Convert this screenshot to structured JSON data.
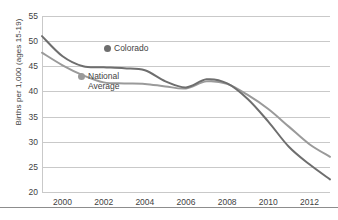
{
  "chart_data": {
    "type": "line",
    "title": "",
    "xlabel": "",
    "ylabel": "Births per 1,000 (ages 15-19)",
    "ylim": [
      20,
      55
    ],
    "xlim": [
      1999,
      2013
    ],
    "ytick_labels": [
      "20",
      "25",
      "30",
      "35",
      "40",
      "45",
      "50",
      "55"
    ],
    "ytick_values": [
      20,
      25,
      30,
      35,
      40,
      45,
      50,
      55
    ],
    "xtick_labels": [
      "2000",
      "2002",
      "2004",
      "2006",
      "2008",
      "2010",
      "2012"
    ],
    "xtick_values": [
      2000,
      2002,
      2004,
      2006,
      2008,
      2010,
      2012
    ],
    "grid": "horizontal",
    "legend_position": "inside-upper-left",
    "x": [
      1999,
      2000,
      2001,
      2002,
      2003,
      2004,
      2005,
      2006,
      2007,
      2008,
      2009,
      2010,
      2011,
      2012,
      2013
    ],
    "series": [
      {
        "name": "Colorado",
        "color": "#6e6e6e",
        "marker": "circle",
        "values": [
          51.0,
          47.0,
          45.0,
          44.8,
          44.6,
          44.2,
          42.0,
          40.8,
          42.4,
          41.6,
          38.5,
          34.0,
          29.0,
          25.5,
          22.5
        ]
      },
      {
        "name": "National Average",
        "color": "#9a9a9a",
        "marker": "circle",
        "values": [
          47.7,
          45.2,
          43.2,
          41.8,
          41.6,
          41.5,
          41.0,
          40.6,
          42.0,
          41.5,
          39.3,
          36.5,
          33.0,
          29.5,
          27.0
        ]
      }
    ],
    "annotations": []
  },
  "legend": {
    "entries": [
      {
        "label": "Colorado",
        "dot_name": "legend-dot-colorado"
      },
      {
        "label": "National Average",
        "dot_name": "legend-dot-national-average"
      }
    ]
  },
  "colors": {
    "gridline": "#c9c9c9",
    "axis": "#c9c9c9",
    "text": "#3f3f3f",
    "background": "#ffffff",
    "rule": "#8d8d8d"
  }
}
